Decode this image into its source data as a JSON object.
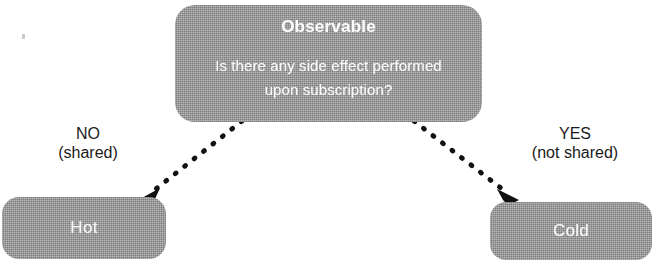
{
  "diagram": {
    "background_color": "#ffffff",
    "node_fill_color": "#9c9c9c",
    "node_text_color": "#ffffff",
    "edge_color": "#111111",
    "label_text_color": "#1a1a1a"
  },
  "nodes": {
    "observable": {
      "title": "Observable",
      "question_line1": "Is there any side effect performed",
      "question_line2": "upon subscription?"
    },
    "hot": {
      "label": "Hot"
    },
    "cold": {
      "label": "Cold"
    }
  },
  "edges": [
    {
      "id": "edge-no",
      "answer": "NO",
      "qualifier": "(shared)",
      "from": "observable",
      "to": "hot",
      "style": "dotted",
      "arrowhead": "filled-triangle"
    },
    {
      "id": "edge-yes",
      "answer": "YES",
      "qualifier": "(not shared)",
      "from": "observable",
      "to": "cold",
      "style": "dotted",
      "arrowhead": "filled-triangle"
    }
  ],
  "icons": {
    "arrowhead_no": "arrow-down-left-icon",
    "arrowhead_yes": "arrow-down-right-icon"
  }
}
